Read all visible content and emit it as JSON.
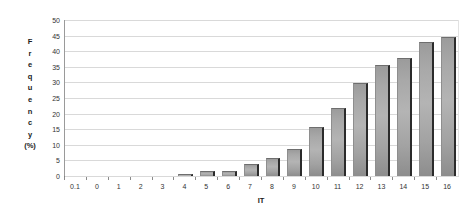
{
  "chart_data": {
    "type": "bar",
    "title": "",
    "subtitle": "",
    "xlabel": "IT",
    "ylabel": "Frequency (%)",
    "ylabel_letters": [
      "F",
      "r",
      "e",
      "q",
      "u",
      "e",
      "n",
      "c",
      "y",
      "(%)"
    ],
    "categories": [
      "0.1",
      "0",
      "1",
      "2",
      "3",
      "4",
      "5",
      "6",
      "7",
      "8",
      "9",
      "10",
      "11",
      "12",
      "13",
      "14",
      "15",
      "16"
    ],
    "values": [
      0,
      0,
      0,
      0,
      0,
      0.8,
      1.7,
      1.7,
      3.7,
      5.7,
      8.6,
      15.8,
      21.8,
      29.7,
      35.6,
      37.8,
      42.8,
      44.7
    ],
    "ylim": [
      0,
      50
    ],
    "ytick_values": [
      0,
      5,
      10,
      15,
      20,
      25,
      30,
      35,
      40,
      45,
      50
    ],
    "ytick_labels": [
      "0",
      "5",
      "10",
      "15",
      "20",
      "25",
      "30",
      "35",
      "40",
      "45",
      "50"
    ],
    "grid": true,
    "grid_axis": "y",
    "legend": false,
    "legend_position": "none",
    "bar_color": "#a8a8a8",
    "bar_edge_color": "#2b2b2b",
    "gridline_color": "#d9d9d9",
    "axis_color": "#6a6a6a",
    "text_color": "#333333",
    "background_color": "#ffffff"
  }
}
